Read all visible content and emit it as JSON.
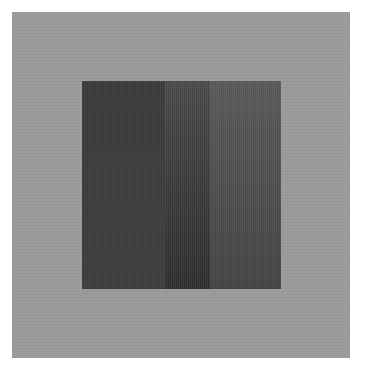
{
  "image": {
    "description": "Grayscale reproduction of an abstract color-field composition: a dark square divided into three vertical bands, centered on a lighter gray ground.",
    "colors": {
      "page_background": "#ffffff",
      "outer_ground": "#9b9b9b",
      "band_left": "#3b3b3b",
      "band_middle_top": "#4a4a4a",
      "band_middle_bottom": "#2e2e2e",
      "band_right_top": "#5a5a5a",
      "band_right_bottom": "#444444"
    },
    "bands": [
      {
        "name": "left",
        "width": 83,
        "color_top": "#3a3a3a",
        "color_bottom": "#3c3c3c"
      },
      {
        "name": "middle",
        "width": 45,
        "color_top": "#4a4a4a",
        "color_bottom": "#2e2e2e"
      },
      {
        "name": "right",
        "width": 71,
        "color_top": "#5a5a5a",
        "color_bottom": "#444444"
      }
    ]
  }
}
